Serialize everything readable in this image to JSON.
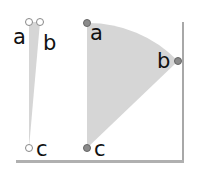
{
  "diagram": {
    "colors": {
      "fill": "#d6d6d6",
      "point_fill_right": "#8a8a8a",
      "point_fill_left": "#ffffff",
      "point_stroke": "#888888",
      "frame_shadow": "#a8a8a8"
    },
    "left_sector": {
      "points": [
        {
          "label": "a",
          "x": 29,
          "y": 22
        },
        {
          "label": "b",
          "x": 40,
          "y": 22
        },
        {
          "label": "c",
          "x": 29,
          "y": 148
        }
      ]
    },
    "right_sector": {
      "points": [
        {
          "label": "a",
          "x": 87,
          "y": 23
        },
        {
          "label": "b",
          "x": 178,
          "y": 61
        },
        {
          "label": "c",
          "x": 87,
          "y": 148
        }
      ]
    }
  }
}
